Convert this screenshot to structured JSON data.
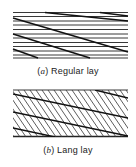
{
  "figures": [
    {
      "id": "a",
      "label_letter": "a",
      "caption_text": "Regular lay",
      "description": "Wire rope strands with wires parallel to rope axis"
    },
    {
      "id": "b",
      "label_letter": "b",
      "caption_text": "Lang lay",
      "description": "Wire rope strands with wires diagonal to rope axis"
    }
  ],
  "colors": {
    "line": "#222222",
    "background": "#ffffff"
  }
}
